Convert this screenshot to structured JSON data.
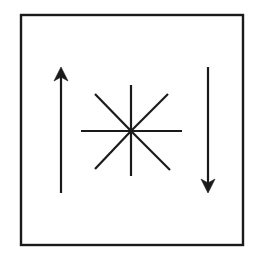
{
  "figure": {
    "title": "",
    "canvas": {
      "width": 257,
      "height": 260,
      "background": "#ffffff"
    },
    "frame": {
      "name": "rectangular-border",
      "x": 21,
      "y": 15,
      "width": 222,
      "height": 230,
      "stroke_color": "#1a1a1a",
      "stroke_width": 2.4,
      "fill": "none"
    },
    "starburst": {
      "name": "eight-ray-asterisk",
      "center_x": 131,
      "center_y": 131,
      "ray_count": 8,
      "radius_orthogonal": 50,
      "radius_diagonal": 51,
      "stroke_color": "#1a1a1a",
      "stroke_width": 2.2,
      "rays": [
        {
          "label": "ray-west",
          "x1": 81,
          "y1": 131,
          "x2": 131,
          "y2": 131
        },
        {
          "label": "ray-east",
          "x1": 131,
          "y1": 131,
          "x2": 182,
          "y2": 131
        },
        {
          "label": "ray-north",
          "x1": 131,
          "y1": 85,
          "x2": 131,
          "y2": 131
        },
        {
          "label": "ray-south",
          "x1": 131,
          "y1": 131,
          "x2": 131,
          "y2": 176
        },
        {
          "label": "ray-northwest",
          "x1": 95,
          "y1": 94,
          "x2": 131,
          "y2": 131
        },
        {
          "label": "ray-southeast",
          "x1": 131,
          "y1": 131,
          "x2": 170,
          "y2": 170
        },
        {
          "label": "ray-northeast",
          "x1": 131,
          "y1": 131,
          "x2": 168,
          "y2": 94
        },
        {
          "label": "ray-southwest",
          "x1": 95,
          "y1": 169,
          "x2": 131,
          "y2": 131
        }
      ]
    },
    "arrows": [
      {
        "name": "left-arrow-up",
        "direction": "up",
        "shaft_x": 61,
        "tail_y": 193,
        "tip_y": 67,
        "head_half_width": 7,
        "head_length": 14,
        "stroke_color": "#1a1a1a",
        "stroke_width": 2.2
      },
      {
        "name": "right-arrow-down",
        "direction": "down",
        "shaft_x": 208,
        "tail_y": 67,
        "tip_y": 193,
        "head_half_width": 7,
        "head_length": 14,
        "stroke_color": "#1a1a1a",
        "stroke_width": 2.2
      }
    ]
  }
}
